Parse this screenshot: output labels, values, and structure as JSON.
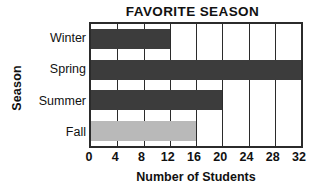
{
  "chart_data": {
    "type": "bar",
    "orientation": "horizontal",
    "title": "FAVORITE SEASON",
    "xlabel": "Number of Students",
    "ylabel": "Season",
    "categories": [
      "Winter",
      "Spring",
      "Summer",
      "Fall"
    ],
    "values": [
      12,
      32,
      20,
      16
    ],
    "xlim": [
      0,
      32
    ],
    "xticks": [
      0,
      4,
      8,
      12,
      16,
      20,
      24,
      28,
      32
    ],
    "xtick_labels": [
      "0",
      "4",
      "8",
      "12",
      "16",
      "20",
      "24",
      "28",
      "32"
    ],
    "grid": true,
    "grid_axis": "x",
    "legend": false,
    "bar_colors": [
      "#3c3c3c",
      "#3c3c3c",
      "#3c3c3c",
      "#b9b9b9"
    ],
    "axis_color": "#2b2b2b",
    "background": "#ffffff"
  }
}
